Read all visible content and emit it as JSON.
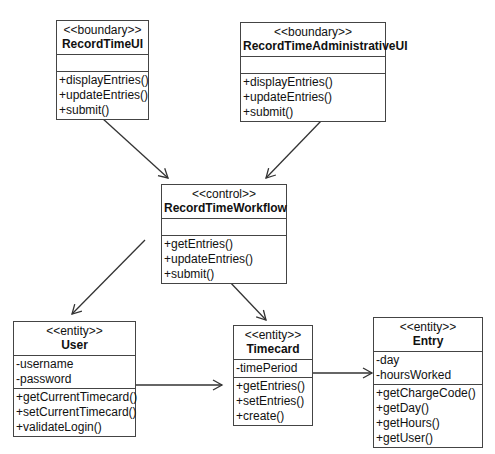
{
  "classes": {
    "record_time_ui": {
      "stereotype": "<<boundary>>",
      "name": "RecordTimeUI",
      "attributes": [],
      "operations": [
        "+displayEntries()",
        "+updateEntries()",
        "+submit()"
      ]
    },
    "record_time_admin_ui": {
      "stereotype": "<<boundary>>",
      "name": "RecordTimeAdministrativeUI",
      "attributes": [],
      "operations": [
        "+displayEntries()",
        "+updateEntries()",
        "+submit()"
      ]
    },
    "record_time_workflow": {
      "stereotype": "<<control>>",
      "name": "RecordTimeWorkflow",
      "attributes": [],
      "operations": [
        "+getEntries()",
        "+updateEntries()",
        "+submit()"
      ]
    },
    "user": {
      "stereotype": "<<entity>>",
      "name": "User",
      "attributes": [
        "-username",
        "-password"
      ],
      "operations": [
        "+getCurrentTimecard()",
        "+setCurrentTimecard()",
        "+validateLogin()"
      ]
    },
    "timecard": {
      "stereotype": "<<entity>>",
      "name": "Timecard",
      "attributes": [
        "-timePeriod"
      ],
      "operations": [
        "+getEntries()",
        "+setEntries()",
        "+create()"
      ]
    },
    "entry": {
      "stereotype": "<<entity>>",
      "name": "Entry",
      "attributes": [
        "-day",
        "-hoursWorked"
      ],
      "operations": [
        "+getChargeCode()",
        "+getDay()",
        "+getHours()",
        "+getUser()"
      ]
    }
  },
  "associations": [
    {
      "from": "RecordTimeUI",
      "to": "RecordTimeWorkflow",
      "type": "directed"
    },
    {
      "from": "RecordTimeAdministrativeUI",
      "to": "RecordTimeWorkflow",
      "type": "directed"
    },
    {
      "from": "RecordTimeWorkflow",
      "to": "User",
      "type": "directed"
    },
    {
      "from": "RecordTimeWorkflow",
      "to": "Timecard",
      "type": "directed"
    },
    {
      "from": "User",
      "to": "Timecard",
      "type": "directed"
    },
    {
      "from": "Timecard",
      "to": "Entry",
      "type": "directed"
    }
  ],
  "colors": {
    "line": "#333333",
    "border": "#444444",
    "background": "#ffffff"
  }
}
